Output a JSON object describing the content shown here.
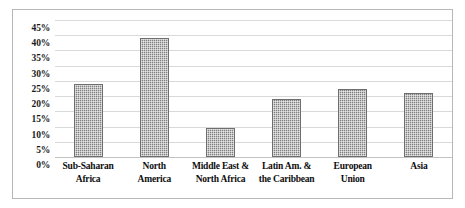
{
  "chart_data": {
    "type": "bar",
    "title": "",
    "subtitle": "",
    "xlabel": "",
    "ylabel": "",
    "categories": [
      "Sub-Saharan Africa",
      "North America",
      "Middle East & North Africa",
      "Latin Am. & the Caribbean",
      "European Union",
      "Asia"
    ],
    "category_lines": [
      [
        "Sub-Saharan",
        "Africa"
      ],
      [
        "North",
        "America"
      ],
      [
        "Middle East &",
        "North Africa"
      ],
      [
        "Latin Am. &",
        "the Caribbean"
      ],
      [
        "European",
        "Union"
      ],
      [
        "Asia"
      ]
    ],
    "values": [
      24,
      39,
      9.5,
      19,
      22.5,
      21
    ],
    "value_labels": [
      "24%",
      "39%",
      "9.5%",
      "19%",
      "22.5%",
      "21%"
    ],
    "ylim": [
      0,
      45
    ],
    "ytick_values": [
      0,
      5,
      10,
      15,
      20,
      25,
      30,
      35,
      40,
      45
    ],
    "ytick_labels": [
      "0%",
      "5%",
      "10%",
      "15%",
      "20%",
      "25%",
      "30%",
      "35%",
      "40%",
      "45%"
    ],
    "grid": true,
    "grid_axis": "y",
    "legend": false,
    "legend_position": "none",
    "series": [
      {
        "name": "",
        "values": [
          24,
          39,
          9.5,
          19,
          22.5,
          21
        ]
      }
    ]
  },
  "style": {
    "bar_color": "#7f7f7f",
    "bar_border_color": "#6e6e6e",
    "gridline_color": "#d9d9d9",
    "axis_line_color": "#c3c3c3",
    "frame_border_color": "#b7b7b7",
    "plot_background": "#ffffff",
    "text_color": "#1a1a1a"
  }
}
